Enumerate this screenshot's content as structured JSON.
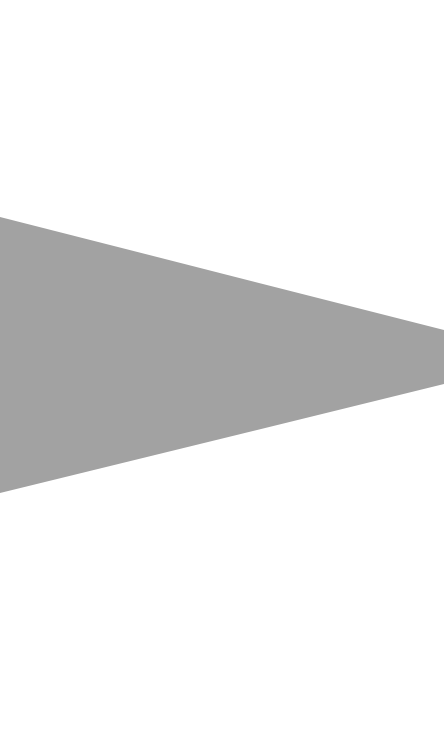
{
  "canvas": {
    "width": 444,
    "height": 733,
    "background": "#ffffff"
  },
  "shape": {
    "type": "polygon",
    "description": "gray wedge pointing right",
    "fill": "#a2a2a2",
    "points": "0,217 444,330 444,384 0,493"
  }
}
